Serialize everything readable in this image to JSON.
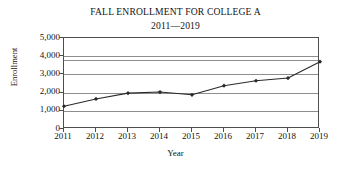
{
  "chart_data": {
    "type": "line",
    "title": "FALL ENROLLMENT FOR COLLEGE A",
    "subtitle": "2011—2019",
    "xlabel": "Year",
    "ylabel": "Enrollment",
    "categories": [
      "2011",
      "2012",
      "2013",
      "2014",
      "2015",
      "2016",
      "2017",
      "2018",
      "2019"
    ],
    "x": [
      2011,
      2012,
      2013,
      2014,
      2015,
      2016,
      2017,
      2018,
      2019
    ],
    "values": [
      1250,
      1650,
      1970,
      2030,
      1880,
      2380,
      2650,
      2800,
      3700
    ],
    "series": [
      {
        "name": "Enrollment",
        "values": [
          1250,
          1650,
          1970,
          2030,
          1880,
          2380,
          2650,
          2800,
          3700
        ]
      }
    ],
    "ylim": [
      0,
      5000
    ],
    "yticks": [
      0,
      1000,
      2000,
      3000,
      4000,
      5000
    ],
    "ytick_labels": [
      "0",
      "1,000",
      "2,000",
      "3,000",
      "4,000",
      "5,000"
    ],
    "grid": true,
    "grid_axis": "y",
    "legend": false,
    "legend_position": "none",
    "marker": "diamond",
    "line_color": "#2a2a2a",
    "grid_color": "#8d8d8d",
    "axis_color": "#4e4e4e",
    "background_color": "#ffffff",
    "artifact_line_value": 3800
  }
}
